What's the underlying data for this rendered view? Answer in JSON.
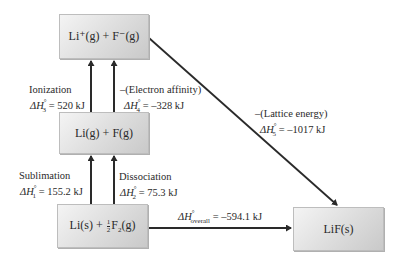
{
  "diagram": {
    "type": "born-haber-cycle",
    "nodes": {
      "top": {
        "species": "Li⁺(g) + F⁻(g)"
      },
      "middle": {
        "species": "Li(g) + F(g)"
      },
      "bottom": {
        "species_a": "Li(s) + ",
        "frac_num": "1",
        "frac_den": "2",
        "species_b": "F",
        "species_b_sub": "2",
        "species_c": "(g)"
      },
      "product": {
        "species": "LiF(s)"
      }
    },
    "steps": {
      "sublimation": {
        "name": "Sublimation",
        "symbol": "ΔH",
        "index": "1",
        "value": "= 155.2 kJ"
      },
      "dissociation": {
        "name": "Dissociation",
        "symbol": "ΔH",
        "index": "2",
        "value": "= 75.3 kJ"
      },
      "ionization": {
        "name": "Ionization",
        "symbol": "ΔH",
        "index": "3",
        "value": "= 520 kJ"
      },
      "electron_affinity": {
        "name": "–(Electron affinity)",
        "symbol": "ΔH",
        "index": "4",
        "value": "= –328 kJ"
      },
      "lattice": {
        "name": "–(Lattice energy)",
        "symbol": "ΔH",
        "index": "5",
        "value": "= –1017 kJ"
      },
      "overall": {
        "symbol": "ΔH",
        "index": "overall",
        "value": "= –594.1 kJ"
      }
    },
    "degree_mark": "°",
    "colors": {
      "box_light": "#f4f4f4",
      "box_dark": "#c9c9c9",
      "arrow": "#2a2a2a"
    }
  }
}
